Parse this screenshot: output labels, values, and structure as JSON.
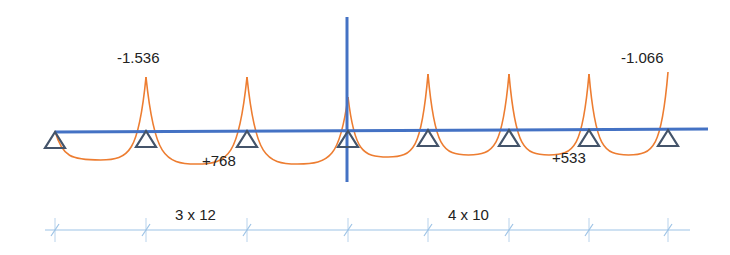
{
  "diagram": {
    "colors": {
      "beam": "#4472C4",
      "support": "#44546A",
      "moment_curve": "#ED7D31",
      "dimension_line": "#9DC3E6",
      "text": "#222222"
    },
    "beam": {
      "x1": 55,
      "y1": 132,
      "x2": 708,
      "y2": 129
    },
    "symmetry_axis": {
      "x": 347,
      "y1": 17,
      "y2": 182
    },
    "supports": [
      {
        "x": 55,
        "y": 132
      },
      {
        "x": 146,
        "y": 131
      },
      {
        "x": 247,
        "y": 131
      },
      {
        "x": 348,
        "y": 131
      },
      {
        "x": 428,
        "y": 130
      },
      {
        "x": 509,
        "y": 130
      },
      {
        "x": 589,
        "y": 130
      },
      {
        "x": 668,
        "y": 130
      }
    ],
    "moment_spans": [
      {
        "from": 55,
        "to": 146,
        "start_y": 131,
        "end_y": 77,
        "sag_y": 160
      },
      {
        "from": 146,
        "to": 247,
        "start_y": 77,
        "end_y": 77,
        "sag_y": 164
      },
      {
        "from": 247,
        "to": 348,
        "start_y": 77,
        "end_y": 97,
        "sag_y": 164
      },
      {
        "from": 348,
        "to": 428,
        "start_y": 97,
        "end_y": 74,
        "sag_y": 157
      },
      {
        "from": 428,
        "to": 509,
        "start_y": 74,
        "end_y": 74,
        "sag_y": 155
      },
      {
        "from": 509,
        "to": 589,
        "start_y": 74,
        "end_y": 74,
        "sag_y": 155
      },
      {
        "from": 589,
        "to": 668,
        "start_y": 74,
        "end_y": 72,
        "sag_y": 155
      }
    ],
    "labels": {
      "left_negative_moment": "-1.536",
      "right_negative_moment": "-1.066",
      "left_positive_moment": "+768",
      "right_positive_moment": "+533",
      "left_spans": "3 x 12",
      "right_spans": "4 x 10"
    },
    "dimension_line": {
      "y": 230,
      "x1": 45,
      "x2": 690,
      "ticks": [
        55,
        146,
        247,
        348,
        428,
        509,
        589,
        668
      ]
    }
  }
}
